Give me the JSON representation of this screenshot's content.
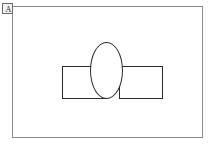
{
  "panel": {
    "label": "A",
    "label_box_border_color": "#6b6b6b",
    "label_box_fill_color": "#f2f2f0"
  },
  "canvas": {
    "border_color": "#8c8c8c",
    "background_color": "#ffffff",
    "width_px": 191,
    "height_px": 132
  },
  "figure": {
    "background_color": "#ffffff",
    "stroke_color": "#2b2b2b",
    "fill_color": "#ffffff",
    "width_px": 210,
    "height_px": 147
  },
  "shapes": [
    {
      "name": "rectangle-left",
      "type": "rectangle",
      "x": 49,
      "y": 59,
      "width": 44,
      "height": 33,
      "stroke": "#2b2b2b",
      "fill": "#ffffff"
    },
    {
      "name": "rectangle-right",
      "type": "rectangle",
      "x": 106,
      "y": 59,
      "width": 44,
      "height": 33,
      "stroke": "#2b2b2b",
      "fill": "#ffffff"
    },
    {
      "name": "ellipse-center",
      "type": "ellipse",
      "x": 77,
      "y": 35,
      "width": 33,
      "height": 57,
      "stroke": "#2b2b2b",
      "fill": "#ffffff"
    }
  ]
}
